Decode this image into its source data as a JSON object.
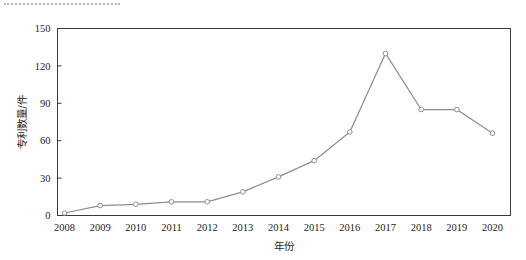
{
  "figure": {
    "background_color": "#ffffff",
    "frame_color": "#3a3a3a",
    "artifact_name": "dotted-scan-line"
  },
  "chart_data": {
    "type": "line",
    "title": "",
    "xlabel": "年份",
    "ylabel": "专利数量/件",
    "categories": [
      "2008",
      "2009",
      "2010",
      "2011",
      "2012",
      "2013",
      "2014",
      "2015",
      "2016",
      "2017",
      "2018",
      "2019",
      "2020"
    ],
    "values": [
      2,
      8,
      9,
      11,
      11,
      19,
      31,
      44,
      67,
      130,
      85,
      85,
      66
    ],
    "series": [
      {
        "name": "专利数量",
        "values": [
          2,
          8,
          9,
          11,
          11,
          19,
          31,
          44,
          67,
          130,
          85,
          85,
          66
        ],
        "line_color": "#8e8e92",
        "marker": "open-circle",
        "marker_fill": "#ffffff"
      }
    ],
    "ylim": [
      0,
      150
    ],
    "yticks": [
      0,
      30,
      60,
      90,
      120,
      150
    ],
    "ytick_labels": [
      "0",
      "30",
      "60",
      "90",
      "120",
      "150"
    ],
    "xticks": [
      "2008",
      "2009",
      "2010",
      "2011",
      "2012",
      "2013",
      "2014",
      "2015",
      "2016",
      "2017",
      "2018",
      "2019",
      "2020"
    ],
    "grid": false,
    "legend": null,
    "legend_position": "none",
    "annotations": []
  }
}
